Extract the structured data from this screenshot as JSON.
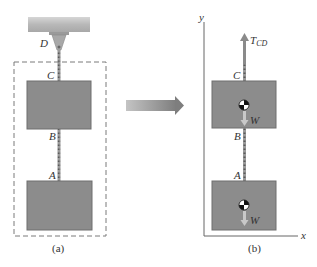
{
  "figure": {
    "panel_a": {
      "caption": "(a)",
      "support_label": "D",
      "points": {
        "C": "C",
        "B": "B",
        "A": "A"
      }
    },
    "panel_b": {
      "caption": "(b)",
      "axis_x": "x",
      "axis_y": "y",
      "tension_label": "T",
      "tension_subscript": "CD",
      "points": {
        "C": "C",
        "B": "B",
        "A": "A"
      },
      "weight_label_upper": "W",
      "weight_label_lower": "W"
    },
    "colors": {
      "block": "#8c8c8c",
      "block_border": "#6e6e6e",
      "ceiling": "#b5b5b5",
      "dash": "#7a7a7a",
      "axis": "#666666",
      "arrow": "#8a8a8a",
      "weight_arrow": "#c8c8c8"
    }
  }
}
